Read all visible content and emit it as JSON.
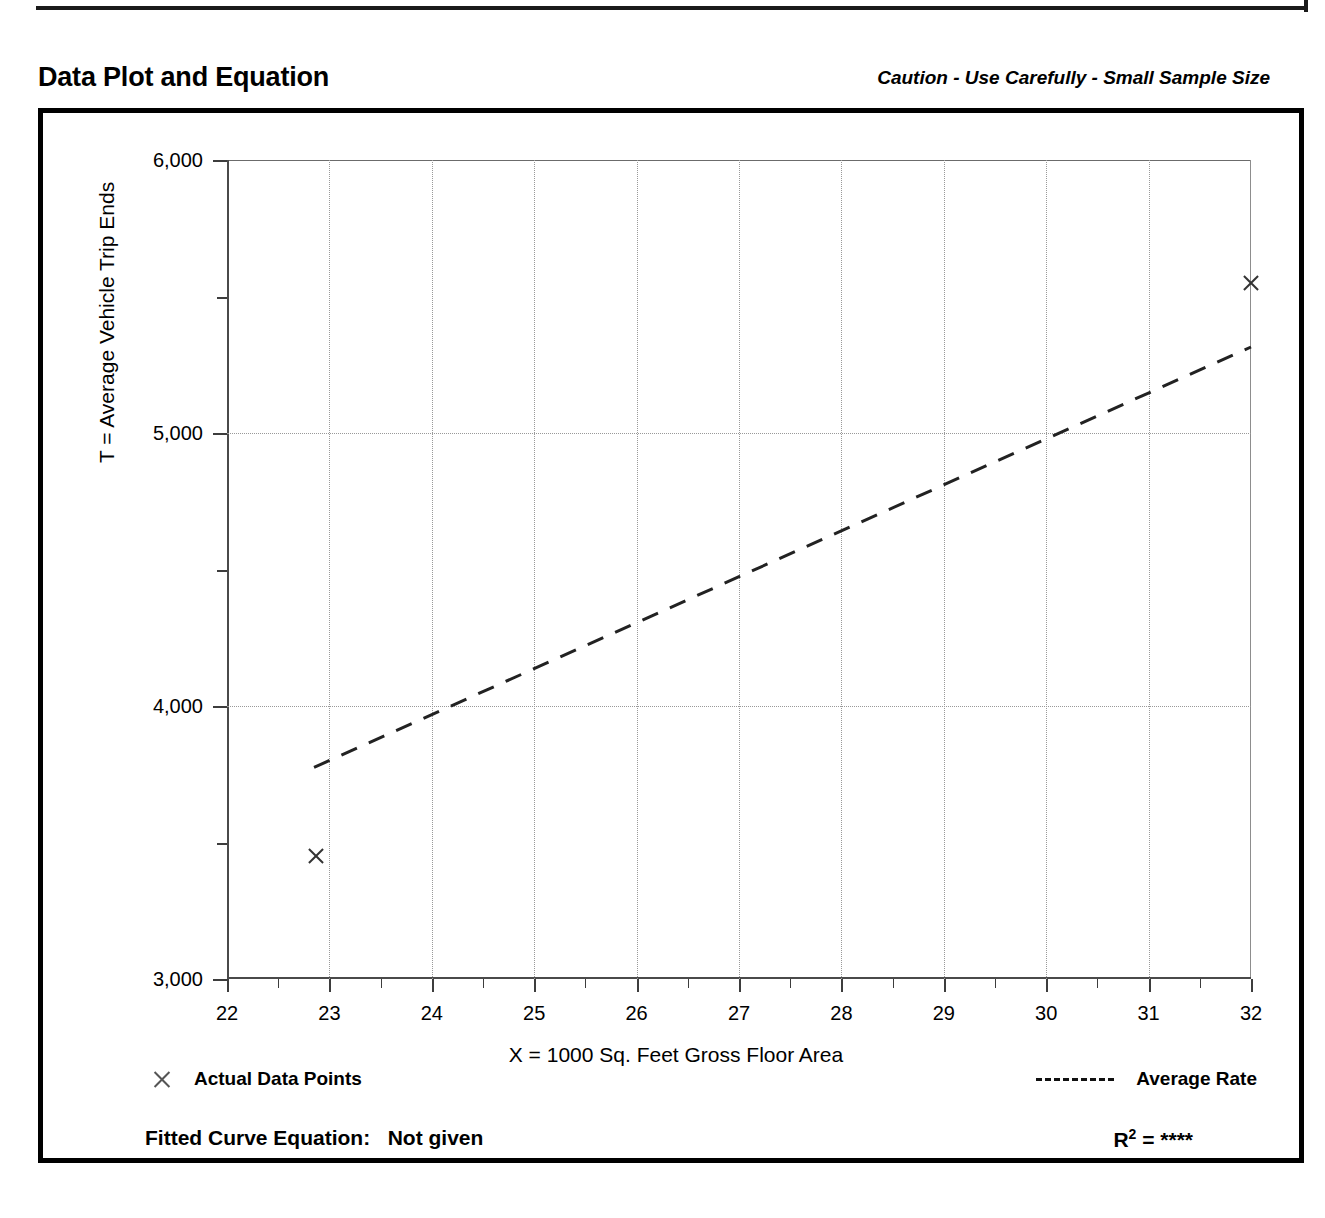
{
  "header": {
    "title": "Data Plot and Equation",
    "caution": "Caution - Use Carefully - Small Sample Size"
  },
  "legend": {
    "points_marker": "x-marker-icon",
    "points_label": "Actual Data Points",
    "rate_marker": "dashed-line-icon",
    "rate_label": "Average Rate"
  },
  "footer": {
    "equation_label": "Fitted Curve Equation:",
    "equation_value": "Not given",
    "r2_symbol": "R",
    "r2_exponent": "2",
    "r2_equals": "=",
    "r2_value": "****"
  },
  "chart_data": {
    "type": "scatter",
    "title": "Data Plot and Equation",
    "subtitle": "Caution - Use Carefully - Small Sample Size",
    "xlabel": "X = 1000 Sq. Feet Gross Floor Area",
    "ylabel": "T = Average Vehicle Trip Ends",
    "xlim": [
      22,
      32
    ],
    "ylim": [
      3000,
      6000
    ],
    "grid": true,
    "legend_position": "below-axes",
    "xticks": [
      22,
      23,
      24,
      25,
      26,
      27,
      28,
      29,
      30,
      31,
      32
    ],
    "xtick_labels": [
      "22",
      "23",
      "24",
      "25",
      "26",
      "27",
      "28",
      "29",
      "30",
      "31",
      "32"
    ],
    "x_minor_ticks": [
      22.5,
      23.5,
      24.5,
      25.5,
      26.5,
      27.5,
      28.5,
      29.5,
      30.5,
      31.5
    ],
    "yticks": [
      3000,
      4000,
      5000,
      6000
    ],
    "ytick_labels": [
      "3,000",
      "4,000",
      "5,000",
      "6,000"
    ],
    "y_minor_ticks": [
      3500,
      4500,
      5500
    ],
    "x_gridlines": [
      23,
      24,
      25,
      26,
      27,
      28,
      29,
      30,
      31
    ],
    "y_gridlines": [
      4000,
      5000
    ],
    "series": [
      {
        "name": "Actual Data Points",
        "type": "scatter",
        "marker": "x",
        "points": [
          {
            "x": 22.87,
            "y": 3450
          },
          {
            "x": 32.0,
            "y": 5550
          }
        ]
      },
      {
        "name": "Average Rate",
        "type": "line",
        "style": "dashed",
        "points": [
          {
            "x": 22.85,
            "y": 3775
          },
          {
            "x": 32.0,
            "y": 5315
          }
        ]
      }
    ]
  }
}
